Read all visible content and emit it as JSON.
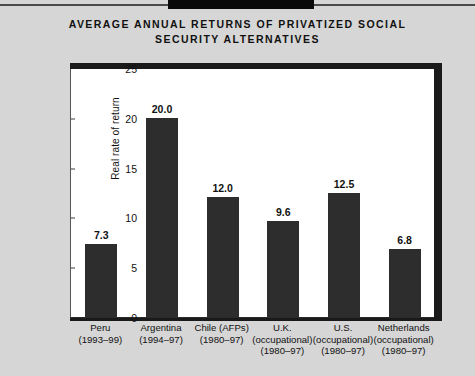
{
  "title": "AVERAGE ANNUAL RETURNS OF PRIVATIZED SOCIAL\nSECURITY ALTERNATIVES",
  "axis": {
    "ylabel": "Real rate of return",
    "yticks": [
      "0",
      "5",
      "10",
      "15",
      "20",
      "25"
    ]
  },
  "bars": [
    {
      "value_label": "7.3",
      "cat": "Peru\n(1993–99)"
    },
    {
      "value_label": "20.0",
      "cat": "Argentina\n(1994–97)"
    },
    {
      "value_label": "12.0",
      "cat": "Chile (AFPs)\n(1980–97)"
    },
    {
      "value_label": "9.6",
      "cat": "U.K.\n(occupational)\n(1980–97)"
    },
    {
      "value_label": "12.5",
      "cat": "U.S.\n(occupational)\n(1980–97)"
    },
    {
      "value_label": "6.8",
      "cat": "Netherlands\n(occupational)\n(1980–97)"
    }
  ],
  "colors": {
    "background": "#d6d6d6",
    "plot_background": "#ffffff",
    "bar": "#2d2d2d",
    "text": "#111111",
    "frame": "#1a1a1a"
  },
  "chart_data": {
    "type": "bar",
    "title": "AVERAGE ANNUAL RETURNS OF PRIVATIZED SOCIAL SECURITY ALTERNATIVES",
    "xlabel": "",
    "ylabel": "Real rate of return",
    "ylim": [
      0,
      25
    ],
    "yticks": [
      0,
      5,
      10,
      15,
      20,
      25
    ],
    "grid": false,
    "legend": "none",
    "categories": [
      "Peru (1993-99)",
      "Argentina (1994-97)",
      "Chile (AFPs) (1980-97)",
      "U.K. (occupational) (1980-97)",
      "U.S. (occupational) (1980-97)",
      "Netherlands (occupational) (1980-97)"
    ],
    "values": [
      7.3,
      20.0,
      12.0,
      9.6,
      12.5,
      6.8
    ],
    "data_labels": [
      "7.3",
      "20.0",
      "12.0",
      "9.6",
      "12.5",
      "6.8"
    ]
  }
}
